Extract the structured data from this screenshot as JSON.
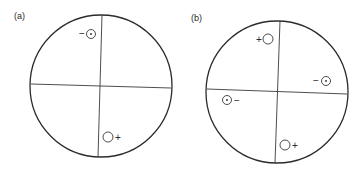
{
  "figure": {
    "background": "#ffffff",
    "ink_color": "#2b2b2b",
    "panels": [
      {
        "id": "a",
        "label": "(a)",
        "label_pos": {
          "x": 14,
          "y": 19
        },
        "circle": {
          "cx": 101,
          "cy": 86,
          "r": 71
        },
        "lines": [
          {
            "name": "vertical-axis",
            "x1": 102,
            "y1": 15,
            "x2": 98,
            "y2": 157
          },
          {
            "name": "horizontal-axis",
            "x1": 31,
            "y1": 84,
            "x2": 171,
            "y2": 88
          }
        ],
        "markers": [
          {
            "type": "dot-circle",
            "sign": "−",
            "cx": 91,
            "cy": 34,
            "r": 4.5,
            "sign_x": 79,
            "sign_y": 37
          },
          {
            "type": "open-circle",
            "sign": "+",
            "cx": 108,
            "cy": 137,
            "r": 5,
            "sign_x": 115,
            "sign_y": 141
          }
        ]
      },
      {
        "id": "b",
        "label": "(b)",
        "label_pos": {
          "x": 191,
          "y": 21
        },
        "circle": {
          "cx": 277,
          "cy": 92,
          "r": 71
        },
        "lines": [
          {
            "name": "vertical-axis",
            "x1": 280,
            "y1": 21,
            "x2": 275,
            "y2": 163
          },
          {
            "name": "horizontal-axis",
            "x1": 207,
            "y1": 89,
            "x2": 347,
            "y2": 94
          }
        ],
        "markers": [
          {
            "type": "open-circle",
            "sign": "+",
            "cx": 268,
            "cy": 39,
            "r": 5,
            "sign_x": 256,
            "sign_y": 43
          },
          {
            "type": "dot-circle",
            "sign": "−",
            "cx": 326,
            "cy": 81,
            "r": 4.5,
            "sign_x": 313,
            "sign_y": 84
          },
          {
            "type": "dot-circle",
            "sign": "−",
            "cx": 227,
            "cy": 100,
            "r": 4.5,
            "sign_x": 234,
            "sign_y": 104
          },
          {
            "type": "open-circle",
            "sign": "+",
            "cx": 285,
            "cy": 145,
            "r": 5,
            "sign_x": 292,
            "sign_y": 149
          }
        ]
      }
    ]
  }
}
